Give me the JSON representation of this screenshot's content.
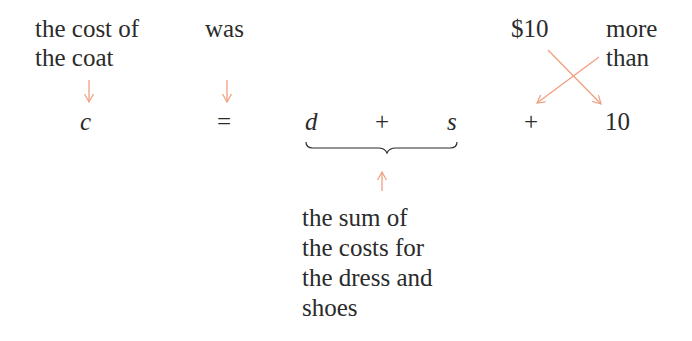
{
  "phrases": {
    "cost_of_coat": "the cost of\nthe coat",
    "was": "was",
    "ten_dollars": "$10",
    "more_than": "more\nthan",
    "sum_description": "the sum of\nthe costs for\nthe dress and\nshoes"
  },
  "equation": {
    "c": "c",
    "equals": "=",
    "d": "d",
    "plus1": "+",
    "s": "s",
    "plus2": "+",
    "ten": "10"
  },
  "colors": {
    "text": "#2b2b2b",
    "arrow": "#f0a080"
  }
}
